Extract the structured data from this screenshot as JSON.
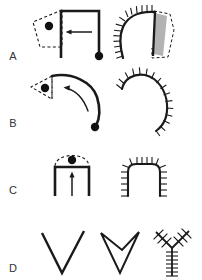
{
  "figure": {
    "title": "",
    "background_color": "#ffffff",
    "stroke_color": "#1a1a1a",
    "fill_gray": "#b3b3b3",
    "label_color": "#333333",
    "width": 202,
    "height": 280,
    "row_labels": [
      {
        "id": "row-a",
        "text": "A",
        "x": 13,
        "y": 60
      },
      {
        "id": "row-b",
        "text": "B",
        "x": 13,
        "y": 127
      },
      {
        "id": "row-c",
        "text": "C",
        "x": 13,
        "y": 194
      },
      {
        "id": "row-d",
        "text": "D",
        "x": 13,
        "y": 272
      }
    ],
    "rows": [
      {
        "id": "A",
        "label": "A",
        "left_panel": {
          "name": "rectangular-arch-with-dashed-wedge",
          "description": "Inverted-U rectangular outline with dashed triangular wedge at upper-left containing a dot, leftward arrow inside, dot at lower-right terminus",
          "has_dot": true,
          "has_dashed_outline": true,
          "arrow_direction": "left",
          "dot_count": 2
        },
        "right_panel": {
          "name": "hatched-hook-with-gray-wedge",
          "description": "Curved hook outline with perpendicular hatch marks along outer boundary, gray-filled wedge with dashed contour on right side",
          "hatched": true,
          "fill": "gray",
          "has_dashed_outline": true
        }
      },
      {
        "id": "B",
        "label": "B",
        "left_panel": {
          "name": "curved-arc-with-dashed-triangle",
          "description": "Thick arc curving from upper-left to lower-right, dashed triangle at left containing a dot, curved leftward arrow, dot at lower-right terminus",
          "has_dot": true,
          "has_dashed_outline": true,
          "arrow_direction": "left-curved",
          "dot_count": 2
        },
        "right_panel": {
          "name": "hatched-crescent-arc",
          "description": "C-shaped crescent arc with perpendicular hatch marks along outer boundary",
          "hatched": true,
          "fill": "none",
          "has_dashed_outline": false
        }
      },
      {
        "id": "C",
        "label": "C",
        "left_panel": {
          "name": "rectangular-arch-with-dashed-cap",
          "description": "Inverted-U rectangular outline with dashed arc cap on top containing a dot, upward arrow inside",
          "has_dot": true,
          "has_dashed_outline": true,
          "arrow_direction": "up",
          "dot_count": 1
        },
        "right_panel": {
          "name": "hatched-rounded-arch",
          "description": "Rounded inverted-U arch with perpendicular hatch marks along outer boundary",
          "hatched": true,
          "fill": "none",
          "has_dashed_outline": false
        }
      },
      {
        "id": "D",
        "label": "D",
        "left_panel": {
          "name": "open-v-shape",
          "description": "Single wide open V (chevron) drawn with thick strokes",
          "hatched": false
        },
        "middle_panel": {
          "name": "double-v-outline",
          "description": "Nested double V forming a closed arrowhead outline",
          "hatched": false
        },
        "right_panel": {
          "name": "hatched-y-skeleton",
          "description": "Y-shaped skeleton with perpendicular hatch marks along all three branches",
          "hatched": true
        }
      }
    ]
  }
}
